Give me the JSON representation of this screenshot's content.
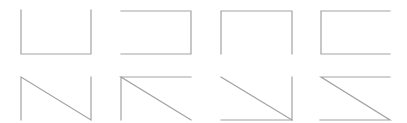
{
  "canvas": {
    "width": 407,
    "height": 123,
    "background": "#ffffff"
  },
  "stroke": {
    "color": "#a3a3a3",
    "width": 1.2
  },
  "shapes": [
    {
      "name": "open-top-rectangle",
      "points": "21,10 21,54 91,54 91,10"
    },
    {
      "name": "open-left-rectangle",
      "points": "121,11 191,11 191,54 121,54"
    },
    {
      "name": "open-bottom-rectangle",
      "points": "221,54 221,11 292,11 292,54"
    },
    {
      "name": "open-right-rectangle",
      "points": "390,11 321,11 321,54 390,54"
    },
    {
      "name": "n-zigzag",
      "points": "21,120 21,77 91,120 91,77"
    },
    {
      "name": "reversed-z-open-bottom",
      "points": "191,77 121,77 191,120 M121,77 121,120"
    },
    {
      "name": "diagonal-corner-bottom-right",
      "points": "221,77 292,120 292,77 M292,120 221,120"
    },
    {
      "name": "z-shape",
      "points": "390,77 321,77 390,120 320,120"
    }
  ]
}
